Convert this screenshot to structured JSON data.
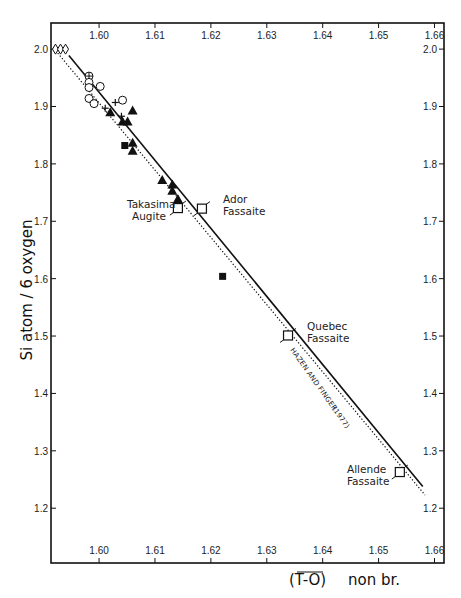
{
  "chart_data": {
    "type": "scatter",
    "title": "",
    "xlabel": "(T-O) non br.",
    "ylabel": "Si atom / 6 oxygen",
    "xlim": [
      1.5914,
      1.6617
    ],
    "ylim": [
      1.1045,
      2.0455
    ],
    "x_ticks": [
      1.6,
      1.61,
      1.62,
      1.63,
      1.64,
      1.65,
      1.66
    ],
    "x_tick_labels": [
      "1.60",
      "1.61",
      "1.62",
      "1.63",
      "1.64",
      "1.65",
      "1.66"
    ],
    "y_ticks": [
      2.0,
      1.9,
      1.8,
      1.7,
      1.6,
      1.5,
      1.4,
      1.3,
      1.2
    ],
    "y_tick_labels": [
      "2.0",
      "1.9",
      "1.8",
      "1.7",
      "1.6",
      "1.5",
      "1.4",
      "1.3",
      "1.2"
    ],
    "ticks_on_all_sides": true,
    "grid": false,
    "legend": null,
    "series": [
      {
        "name": "open diamonds",
        "marker": "diamond-open",
        "points": [
          [
            1.5922,
            2.0
          ],
          [
            1.5931,
            2.0
          ],
          [
            1.594,
            2.0
          ]
        ]
      },
      {
        "name": "circle-plus",
        "marker": "circle-plus",
        "points": [
          [
            1.5982,
            1.953
          ]
        ]
      },
      {
        "name": "open circles",
        "marker": "circle-open",
        "points": [
          [
            1.5982,
            1.942
          ],
          [
            1.5982,
            1.933
          ],
          [
            1.6002,
            1.935
          ],
          [
            1.5982,
            1.914
          ],
          [
            1.5991,
            1.905
          ],
          [
            1.6042,
            1.911
          ]
        ]
      },
      {
        "name": "crosses",
        "marker": "plus",
        "points": [
          [
            1.6011,
            1.897
          ],
          [
            1.6029,
            1.907
          ],
          [
            1.604,
            1.883
          ]
        ]
      },
      {
        "name": "filled triangles",
        "marker": "triangle-filled",
        "points": [
          [
            1.602,
            1.89
          ],
          [
            1.6042,
            1.874
          ],
          [
            1.6051,
            1.874
          ],
          [
            1.606,
            1.893
          ],
          [
            1.606,
            1.837
          ],
          [
            1.606,
            1.823
          ],
          [
            1.6113,
            1.772
          ],
          [
            1.6131,
            1.764
          ],
          [
            1.6131,
            1.753
          ],
          [
            1.6141,
            1.739
          ]
        ]
      },
      {
        "name": "filled squares",
        "marker": "square-filled",
        "points": [
          [
            1.6046,
            1.832
          ],
          [
            1.6221,
            1.604
          ]
        ]
      },
      {
        "name": "labeled fassaites/augite",
        "marker": "square-open-tailed",
        "points": [
          [
            1.6141,
            1.723
          ],
          [
            1.6184,
            1.722
          ],
          [
            1.6338,
            1.501
          ],
          [
            1.6538,
            1.263
          ]
        ]
      }
    ],
    "annotations": [
      {
        "text_lines": [
          "Takasima",
          "Augite"
        ],
        "x": 1.6141,
        "y": 1.723
      },
      {
        "text_lines": [
          "Ador",
          "Fassaite"
        ],
        "x": 1.6184,
        "y": 1.722
      },
      {
        "text_lines": [
          "Quebec",
          "Fassaite"
        ],
        "x": 1.6338,
        "y": 1.501
      },
      {
        "text_lines": [
          "Allende",
          "Fassaite"
        ],
        "x": 1.6538,
        "y": 1.263
      }
    ],
    "lines": [
      {
        "name": "regression (solid)",
        "style": "solid",
        "from": [
          1.5946,
          1.989
        ],
        "to": [
          1.6579,
          1.238
        ]
      },
      {
        "name": "HAZEN AND FINGER (1977)",
        "style": "dotted",
        "from": [
          1.5926,
          1.993
        ],
        "to": [
          1.6583,
          1.223
        ]
      }
    ]
  },
  "labels": {
    "xlabel_main": "(T-O)",
    "xlabel_suffix": "non  br.",
    "ylabel": "Si  atom / 6  oxygen",
    "reference_line": "HAZEN AND FINGER",
    "reference_year": "(1977)",
    "takasima_1": "Takasima",
    "takasima_2": "Augite",
    "ador_1": "Ador",
    "ador_2": "Fassaite",
    "quebec_1": "Quebec",
    "quebec_2": "Fassaite",
    "allende_1": "Allende",
    "allende_2": "Fassaite"
  }
}
